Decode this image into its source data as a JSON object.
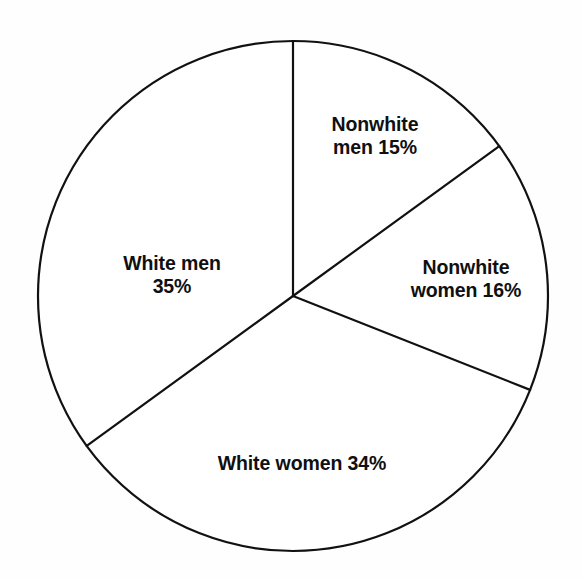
{
  "chart_data": {
    "type": "pie",
    "title": "",
    "subtitle": "",
    "xlabel": "",
    "ylabel": "",
    "legend_position": "none",
    "grid": false,
    "start_angle_deg": 0,
    "direction": "clockwise",
    "units": "percent",
    "total": 100,
    "categories": [
      "Nonwhite men",
      "Nonwhite women",
      "White women",
      "White men"
    ],
    "values": [
      15,
      16,
      34,
      35
    ],
    "slices": [
      {
        "name": "nonwhite-men",
        "category": "Nonwhite men",
        "value": 15,
        "label_line_1": "Nonwhite",
        "label_line_2": "men 15%",
        "label_text": "Nonwhite men 15%",
        "fill": "#ffffff",
        "stroke": "#111111"
      },
      {
        "name": "nonwhite-women",
        "category": "Nonwhite women",
        "value": 16,
        "label_line_1": "Nonwhite",
        "label_line_2": "women 16%",
        "label_text": "Nonwhite women 16%",
        "fill": "#ffffff",
        "stroke": "#111111"
      },
      {
        "name": "white-women",
        "category": "White women",
        "value": 34,
        "label_line_1": "White women 34%",
        "label_line_2": "",
        "label_text": "White women 34%",
        "fill": "#ffffff",
        "stroke": "#111111"
      },
      {
        "name": "white-men",
        "category": "White men",
        "value": 35,
        "label_line_1": "White men",
        "label_line_2": "35%",
        "label_text": "White men 35%",
        "fill": "#ffffff",
        "stroke": "#111111"
      }
    ]
  },
  "style": {
    "background": "#fefefe",
    "stroke_color": "#111111",
    "slice_fill": "#ffffff",
    "text_color": "#101010"
  },
  "geometry": {
    "center_x": 293,
    "center_y": 296,
    "radius": 255,
    "stroke_width": 2.2
  }
}
